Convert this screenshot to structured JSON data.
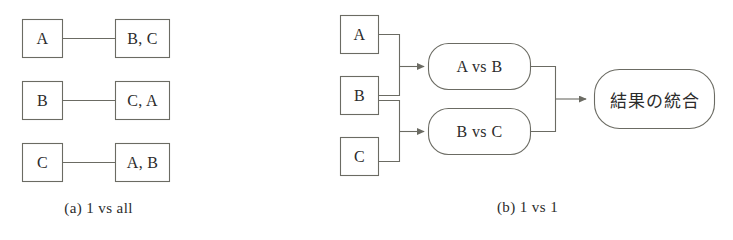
{
  "figure": {
    "background_color": "#ffffff",
    "stroke_color": "#6b6b63",
    "text_color": "#2b2b2b"
  },
  "panel_a": {
    "caption": "(a)  1 vs all",
    "rows": [
      {
        "source": "A",
        "target": "B, C"
      },
      {
        "source": "B",
        "target": "C, A"
      },
      {
        "source": "C",
        "target": "A, B"
      }
    ]
  },
  "panel_b": {
    "caption": "(b)  1 vs 1",
    "inputs": [
      "A",
      "B",
      "C"
    ],
    "comparators": [
      "A vs B",
      "B vs C"
    ],
    "aggregator": "結果の統合"
  }
}
